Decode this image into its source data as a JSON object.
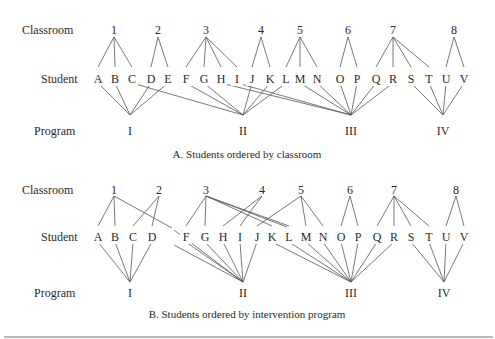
{
  "panels": [
    {
      "id": "A",
      "caption": "A. Students ordered by classroom",
      "row_labels": {
        "classroom": "Classroom",
        "student": "Student",
        "program": "Program"
      },
      "y": {
        "classroom": 30,
        "student": 79,
        "program": 131,
        "class_apex": 37,
        "stud_top": 67,
        "stud_bot": 83,
        "prog_apex": 115,
        "caption": 158
      },
      "classrooms": [
        {
          "label": "1",
          "x": 114
        },
        {
          "label": "2",
          "x": 158
        },
        {
          "label": "3",
          "x": 206
        },
        {
          "label": "4",
          "x": 261
        },
        {
          "label": "5",
          "x": 300
        },
        {
          "label": "6",
          "x": 348
        },
        {
          "label": "7",
          "x": 393
        },
        {
          "label": "8",
          "x": 454
        }
      ],
      "students": [
        {
          "label": "A",
          "x": 98
        },
        {
          "label": "B",
          "x": 115
        },
        {
          "label": "C",
          "x": 132
        },
        {
          "label": "D",
          "x": 151
        },
        {
          "label": "E",
          "x": 168
        },
        {
          "label": "F",
          "x": 186
        },
        {
          "label": "G",
          "x": 204
        },
        {
          "label": "H",
          "x": 221
        },
        {
          "label": "I",
          "x": 237
        },
        {
          "label": "J",
          "x": 252
        },
        {
          "label": "K",
          "x": 270
        },
        {
          "label": "L",
          "x": 286
        },
        {
          "label": "M",
          "x": 300
        },
        {
          "label": "N",
          "x": 317
        },
        {
          "label": "O",
          "x": 340
        },
        {
          "label": "P",
          "x": 357
        },
        {
          "label": "Q",
          "x": 376
        },
        {
          "label": "R",
          "x": 393
        },
        {
          "label": "S",
          "x": 411
        },
        {
          "label": "T",
          "x": 429
        },
        {
          "label": "U",
          "x": 446
        },
        {
          "label": "V",
          "x": 464
        }
      ],
      "programs": [
        {
          "label": "I",
          "x": 130
        },
        {
          "label": "II",
          "x": 243
        },
        {
          "label": "III",
          "x": 351
        },
        {
          "label": "IV",
          "x": 443
        }
      ],
      "class_edges": [
        [
          "1",
          "A"
        ],
        [
          "1",
          "B"
        ],
        [
          "1",
          "C"
        ],
        [
          "2",
          "D"
        ],
        [
          "2",
          "E"
        ],
        [
          "3",
          "F"
        ],
        [
          "3",
          "G"
        ],
        [
          "3",
          "H"
        ],
        [
          "3",
          "I"
        ],
        [
          "4",
          "J"
        ],
        [
          "4",
          "K"
        ],
        [
          "5",
          "L"
        ],
        [
          "5",
          "M"
        ],
        [
          "5",
          "N"
        ],
        [
          "6",
          "O"
        ],
        [
          "6",
          "P"
        ],
        [
          "7",
          "Q"
        ],
        [
          "7",
          "R"
        ],
        [
          "7",
          "S"
        ],
        [
          "7",
          "T"
        ],
        [
          "8",
          "U"
        ],
        [
          "8",
          "V"
        ]
      ],
      "program_edges": [
        [
          "A",
          "I"
        ],
        [
          "B",
          "I"
        ],
        [
          "D",
          "I"
        ],
        [
          "E",
          "I"
        ],
        [
          "C",
          "II"
        ],
        [
          "F",
          "II"
        ],
        [
          "G",
          "II"
        ],
        [
          "J",
          "II"
        ],
        [
          "K",
          "II"
        ],
        [
          "L",
          "II"
        ],
        [
          "H",
          "III"
        ],
        [
          "I",
          "III"
        ],
        [
          "M",
          "III"
        ],
        [
          "N",
          "III"
        ],
        [
          "O",
          "III"
        ],
        [
          "P",
          "III"
        ],
        [
          "Q",
          "III"
        ],
        [
          "R",
          "III"
        ],
        [
          "S",
          "IV"
        ],
        [
          "T",
          "IV"
        ],
        [
          "U",
          "IV"
        ],
        [
          "V",
          "IV"
        ]
      ]
    },
    {
      "id": "B",
      "caption": "B. Students ordered by intervention program",
      "row_labels": {
        "classroom": "Classroom",
        "student": "Student",
        "program": "Program"
      },
      "y": {
        "classroom": 190,
        "student": 237,
        "program": 293,
        "class_apex": 196,
        "stud_top": 226,
        "stud_bot": 242,
        "prog_apex": 282,
        "caption": 318
      },
      "classrooms": [
        {
          "label": "1",
          "x": 114
        },
        {
          "label": "2",
          "x": 159
        },
        {
          "label": "3",
          "x": 206
        },
        {
          "label": "4",
          "x": 262
        },
        {
          "label": "5",
          "x": 301
        },
        {
          "label": "6",
          "x": 350
        },
        {
          "label": "7",
          "x": 394
        },
        {
          "label": "8",
          "x": 456
        }
      ],
      "students": [
        {
          "label": "A",
          "x": 98
        },
        {
          "label": "B",
          "x": 115
        },
        {
          "label": "C",
          "x": 133
        },
        {
          "label": "D",
          "x": 152
        },
        {
          "label": "F",
          "x": 186
        },
        {
          "label": "G",
          "x": 205
        },
        {
          "label": "H",
          "x": 223
        },
        {
          "label": "I",
          "x": 240
        },
        {
          "label": "J",
          "x": 257
        },
        {
          "label": "K",
          "x": 272
        },
        {
          "label": "L",
          "x": 289
        },
        {
          "label": "M",
          "x": 306
        },
        {
          "label": "N",
          "x": 323
        },
        {
          "label": "O",
          "x": 341
        },
        {
          "label": "P",
          "x": 358
        },
        {
          "label": "Q",
          "x": 377
        },
        {
          "label": "R",
          "x": 394
        },
        {
          "label": "S",
          "x": 411
        },
        {
          "label": "T",
          "x": 429
        },
        {
          "label": "U",
          "x": 446
        },
        {
          "label": "V",
          "x": 464
        }
      ],
      "programs": [
        {
          "label": "I",
          "x": 130
        },
        {
          "label": "II",
          "x": 243
        },
        {
          "label": "III",
          "x": 351
        },
        {
          "label": "IV",
          "x": 444
        }
      ],
      "class_edges": [
        [
          "1",
          "A"
        ],
        [
          "1",
          "B"
        ],
        [
          "1",
          "E*"
        ],
        [
          "2",
          "C"
        ],
        [
          "2",
          "D"
        ],
        [
          "3",
          "F"
        ],
        [
          "3",
          "G"
        ],
        [
          "3",
          "K"
        ],
        [
          "3",
          "L"
        ],
        [
          "3",
          "L2"
        ],
        [
          "4",
          "H"
        ],
        [
          "4",
          "I"
        ],
        [
          "5",
          "J"
        ],
        [
          "5",
          "M"
        ],
        [
          "5",
          "N"
        ],
        [
          "6",
          "O"
        ],
        [
          "6",
          "P"
        ],
        [
          "7",
          "Q"
        ],
        [
          "7",
          "R"
        ],
        [
          "7",
          "S"
        ],
        [
          "7",
          "T"
        ],
        [
          "8",
          "U"
        ],
        [
          "8",
          "V"
        ]
      ],
      "program_edges": [
        [
          "A",
          "I"
        ],
        [
          "B",
          "I"
        ],
        [
          "C",
          "I"
        ],
        [
          "D",
          "I"
        ],
        [
          "E*",
          "II"
        ],
        [
          "C*",
          "II"
        ],
        [
          "F",
          "II"
        ],
        [
          "G",
          "II"
        ],
        [
          "H",
          "II"
        ],
        [
          "I",
          "II"
        ],
        [
          "J",
          "II"
        ],
        [
          "K",
          "III"
        ],
        [
          "L",
          "III"
        ],
        [
          "M",
          "III"
        ],
        [
          "N",
          "III"
        ],
        [
          "O",
          "III"
        ],
        [
          "P",
          "III"
        ],
        [
          "Q",
          "III"
        ],
        [
          "R",
          "III"
        ],
        [
          "S",
          "IV"
        ],
        [
          "T",
          "IV"
        ],
        [
          "U",
          "IV"
        ],
        [
          "V",
          "IV"
        ]
      ],
      "stub_points": {
        "E*": {
          "x": 172,
          "y": 228
        },
        "C*": {
          "x": 172,
          "y": 243
        }
      }
    }
  ]
}
